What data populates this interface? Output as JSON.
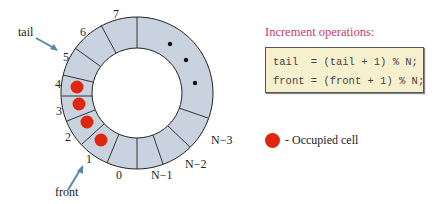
{
  "diagram": {
    "slot_labels": [
      "0",
      "1",
      "2",
      "3",
      "4",
      "5",
      "6",
      "7",
      "N−3",
      "N−2",
      "N−1"
    ],
    "pointers": {
      "tail": "tail",
      "front": "front"
    },
    "occupied_slots": [
      1,
      2,
      3,
      4
    ],
    "ellipsis": "• • •"
  },
  "operations": {
    "title": "Increment operations:",
    "line1": "tail  = (tail + 1) % N;",
    "line2": "front = (front + 1) % N;"
  },
  "legend": {
    "label": "- Occupied cell",
    "color": "#e0260f"
  },
  "colors": {
    "cell": "#c9d3df",
    "occupied": "#e0260f",
    "arrow": "#5a87a8",
    "title": "#c2406a",
    "code_bg": "#f7f0cf"
  }
}
